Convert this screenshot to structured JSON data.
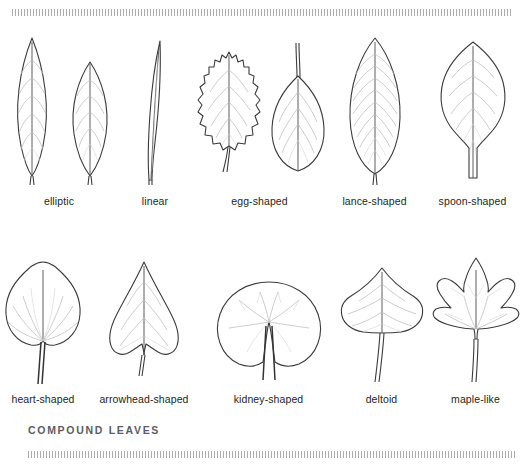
{
  "figure": {
    "rules": {
      "top": "hatched-rule",
      "bottom": "hatched-rule"
    },
    "section_heading": "COMPOUND LEAVES",
    "colors": {
      "outline": "#3b3b3d",
      "vein": "#b9bcc2",
      "caption_text": "#231f20",
      "heading_text": "#5a5d63",
      "rule": "#8d9096",
      "background": "#ffffff"
    }
  },
  "rows": [
    {
      "id": "simple-leaf-shapes-row-1",
      "items": [
        {
          "label": "elliptic",
          "icon": "elliptic-leaf-icon",
          "count": 2
        },
        {
          "label": "linear",
          "icon": "linear-leaf-icon",
          "count": 1
        },
        {
          "label": "egg-shaped",
          "icon": "egg-shaped-leaf-icon",
          "count": 2
        },
        {
          "label": "lance-shaped",
          "icon": "lance-shaped-leaf-icon",
          "count": 1
        },
        {
          "label": "spoon-shaped",
          "icon": "spoon-shaped-leaf-icon",
          "count": 1
        }
      ]
    },
    {
      "id": "simple-leaf-shapes-row-2",
      "items": [
        {
          "label": "heart-shaped",
          "icon": "heart-shaped-leaf-icon",
          "count": 1
        },
        {
          "label": "arrowhead-shaped",
          "icon": "arrowhead-shaped-leaf-icon",
          "count": 1
        },
        {
          "label": "kidney-shaped",
          "icon": "kidney-shaped-leaf-icon",
          "count": 1
        },
        {
          "label": "deltoid",
          "icon": "deltoid-leaf-icon",
          "count": 1
        },
        {
          "label": "maple-like",
          "icon": "maple-like-leaf-icon",
          "count": 1
        }
      ]
    }
  ]
}
